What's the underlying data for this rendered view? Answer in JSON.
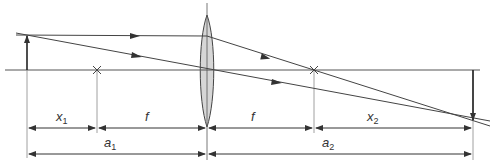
{
  "diagram": {
    "type": "thin converging lens image formation",
    "colors": {
      "line": "#333333",
      "thin_line": "#777777",
      "lens_fill": "#d6d6d6",
      "background": "#ffffff"
    },
    "labels": {
      "x1": {
        "main": "x",
        "sub": "1"
      },
      "f_left": {
        "main": "f"
      },
      "f_right": {
        "main": "f"
      },
      "x2": {
        "main": "x",
        "sub": "2"
      },
      "a1": {
        "main": "a",
        "sub": "1"
      },
      "a2": {
        "main": "a",
        "sub": "2"
      }
    },
    "elements": {
      "optical_axis": "horizontal principal axis",
      "object_arrow": "upright object",
      "image_arrow": "inverted real image",
      "lens": "biconvex lens",
      "focal_points": [
        "F1 (left)",
        "F2 (right)"
      ],
      "rays": [
        "parallel ray refracted through F2",
        "central ray through lens center"
      ]
    }
  }
}
